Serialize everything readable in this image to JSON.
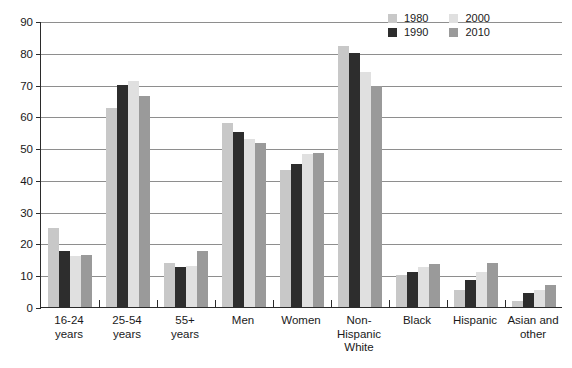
{
  "chart_data": {
    "type": "bar",
    "title": "",
    "xlabel": "",
    "ylabel": "",
    "ylim": [
      0,
      90
    ],
    "ytick_step": 10,
    "yticks": [
      0,
      10,
      20,
      30,
      40,
      50,
      60,
      70,
      80,
      90
    ],
    "grid": true,
    "legend_position": "top-right",
    "categories": [
      "16-24 years",
      "25-54 years",
      "55+ years",
      "Men",
      "Women",
      "Non-Hispanic White",
      "Black",
      "Hispanic",
      "Asian and other"
    ],
    "category_lines": [
      [
        "16-24",
        "years"
      ],
      [
        "25-54",
        "years"
      ],
      [
        "55+",
        "years"
      ],
      [
        "Men"
      ],
      [
        "Women"
      ],
      [
        "Non-",
        "Hispanic",
        "White"
      ],
      [
        "Black"
      ],
      [
        "Hispanic"
      ],
      [
        "Asian and",
        "other"
      ]
    ],
    "series": [
      {
        "name": "1980",
        "color": "#c8c8c8",
        "values": [
          25,
          62.5,
          14,
          58,
          43,
          82,
          10,
          5.5,
          2
        ]
      },
      {
        "name": "1990",
        "color": "#2d2d2d",
        "values": [
          17.5,
          70,
          12.5,
          55,
          45,
          80,
          11,
          8.5,
          4.5
        ]
      },
      {
        "name": "2000",
        "color": "#e0e0e0",
        "values": [
          16,
          71,
          13,
          53,
          48,
          74,
          12.5,
          11,
          5.5
        ]
      },
      {
        "name": "2010",
        "color": "#9a9a9a",
        "values": [
          16.5,
          66.5,
          17.5,
          51.5,
          48.5,
          69.5,
          13.5,
          14,
          7
        ]
      }
    ]
  },
  "legend": {
    "entries": [
      "1980",
      "2000",
      "1990",
      "2010"
    ]
  }
}
